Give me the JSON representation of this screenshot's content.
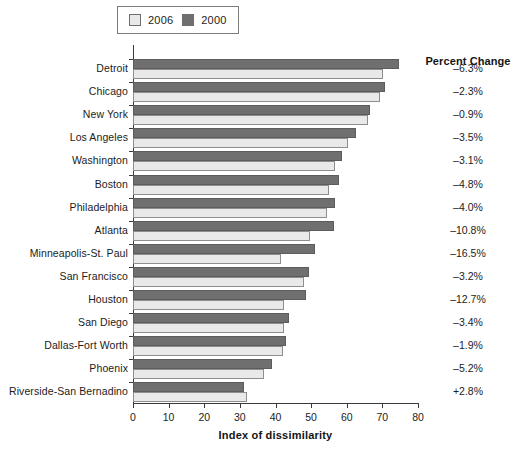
{
  "legend": {
    "entries": [
      {
        "label": "2006",
        "color": "#e9e9e9",
        "swatch_name": "legend-swatch-2006"
      },
      {
        "label": "2000",
        "color": "#6f6f6f",
        "swatch_name": "legend-swatch-2000"
      }
    ]
  },
  "percent_change": {
    "header": "Percent Change",
    "values": [
      "–6.3%",
      "–2.3%",
      "–0.9%",
      "–3.5%",
      "–3.1%",
      "–4.8%",
      "–4.0%",
      "–10.8%",
      "–16.5%",
      "–3.2%",
      "–12.7%",
      "–3.4%",
      "–1.9%",
      "–5.2%",
      "+2.8%"
    ]
  },
  "chart_data": {
    "type": "bar",
    "orientation": "horizontal",
    "title": "",
    "xlabel": "Index of dissimilarity",
    "ylabel": "",
    "xlim": [
      0,
      80
    ],
    "xticks": [
      0,
      10,
      20,
      30,
      40,
      50,
      60,
      70,
      80
    ],
    "grid": false,
    "legend_position": "top-left",
    "categories": [
      "Detroit",
      "Chicago",
      "New York",
      "Los Angeles",
      "Washington",
      "Boston",
      "Philadelphia",
      "Atlanta",
      "Minneapolis-St. Paul",
      "San Francisco",
      "Houston",
      "San Diego",
      "Dallas-Fort Worth",
      "Phoenix",
      "Riverside-San Bernadino"
    ],
    "series": [
      {
        "name": "2000",
        "color": "#6f6f6f",
        "values": [
          74.8,
          70.8,
          66.5,
          62.6,
          58.6,
          57.8,
          56.7,
          56.5,
          51.0,
          49.5,
          48.5,
          43.8,
          43.0,
          39.0,
          31.2
        ]
      },
      {
        "name": "2006",
        "color": "#e9e9e9",
        "values": [
          70.1,
          69.2,
          65.9,
          60.4,
          56.8,
          55.0,
          54.4,
          49.7,
          41.6,
          47.9,
          42.3,
          42.3,
          42.2,
          36.9,
          32.1
        ]
      }
    ],
    "annotations": {
      "percent_change_column": "Percent Change",
      "percent_change_values": [
        "–6.3%",
        "–2.3%",
        "–0.9%",
        "–3.5%",
        "–3.1%",
        "–4.8%",
        "–4.0%",
        "–10.8%",
        "–16.5%",
        "–3.2%",
        "–12.7%",
        "–3.4%",
        "–1.9%",
        "–5.2%",
        "+2.8%"
      ]
    }
  }
}
